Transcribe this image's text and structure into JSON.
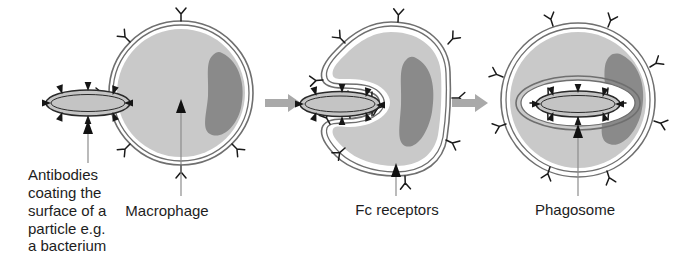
{
  "figure": {
    "title": "Phagocytosis of an antibody-coated particle by a macrophage",
    "background_color": "#ffffff"
  },
  "colors": {
    "cytoplasm": "#c9c9c9",
    "nucleus": "#8a8a8a",
    "membrane_outline": "#6f6f6f",
    "membrane_band": "#ffffff",
    "bacterium_fill": "#c4c4c4",
    "bacterium_outline": "#2a2a2a",
    "receptor_stroke": "#1a1a1a",
    "antibody_fill": "#161616",
    "leader_line": "#8d8d8d",
    "leader_head": "#111111",
    "stage_arrow": "#a9a9a9",
    "text": "#1d1d1d"
  },
  "labels": {
    "antibodies": {
      "name": "antibodies-label",
      "lines": [
        "Antibodies",
        "coating the",
        "surface of a",
        "particle e.g.",
        "a bacterium"
      ]
    },
    "macrophage": {
      "name": "macrophage-label",
      "text": "Macrophage"
    },
    "fc_receptors": {
      "name": "fc-receptors-label",
      "text": "Fc receptors"
    },
    "phagosome": {
      "name": "phagosome-label",
      "text": "Phagosome"
    }
  },
  "stages": [
    {
      "id": "stage-1",
      "name": "binding-stage",
      "description": "Antibody-coated bacterium binds Fc receptors on the macrophage surface",
      "cell_shape": "circle",
      "bacterium_present": true,
      "phagosome_present": false,
      "receptor_count": 6
    },
    {
      "id": "stage-2",
      "name": "engulfment-stage",
      "description": "Macrophage extends pseudopods forming a phagocytic cup around the bacterium",
      "cell_shape": "c-cup",
      "bacterium_present": true,
      "phagosome_present": false,
      "receptor_count": 14
    },
    {
      "id": "stage-3",
      "name": "phagosome-stage",
      "description": "Bacterium fully internalised within a phagosome vesicle",
      "cell_shape": "circle",
      "bacterium_present": true,
      "phagosome_present": true,
      "receptor_count": 14
    }
  ],
  "stage_arrows": [
    {
      "name": "stage-arrow-1",
      "direction": "right"
    },
    {
      "name": "stage-arrow-2",
      "direction": "right"
    }
  ],
  "icons": {
    "receptor": "y-shaped-fc-receptor-icon",
    "antibody": "triangular-antibody-icon",
    "arrow": "right-arrow-icon",
    "leader": "leader-arrow-icon"
  }
}
